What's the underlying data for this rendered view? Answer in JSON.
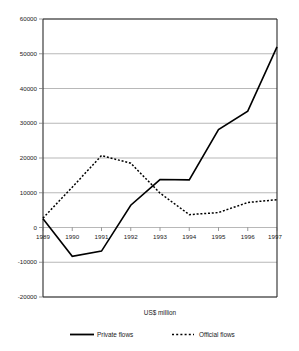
{
  "chart_data": {
    "type": "line",
    "title": "",
    "subtitle": "",
    "xlabel": "US$ million",
    "ylabel": "",
    "x": [
      1989,
      1990,
      1991,
      1992,
      1993,
      1994,
      1995,
      1996,
      1997
    ],
    "categories": [
      "1989",
      "1990",
      "1991",
      "1992",
      "1993",
      "1994",
      "1995",
      "1996",
      "1997"
    ],
    "series": [
      {
        "name": "Private flows",
        "style": "solid",
        "color": "#000000",
        "values": [
          2500,
          -8300,
          -6800,
          6400,
          13800,
          13700,
          28200,
          33500,
          52000
        ]
      },
      {
        "name": "Official flows",
        "style": "dotted",
        "color": "#000000",
        "values": [
          2700,
          11600,
          20700,
          18500,
          9900,
          3700,
          4300,
          7200,
          8000
        ]
      }
    ],
    "ylim": [
      -20000,
      60000
    ],
    "ytick_labels": [
      "60000",
      "50000",
      "40000",
      "30000",
      "20000",
      "10000",
      "0",
      "-10000",
      "-20000"
    ],
    "ytick_values": [
      60000,
      50000,
      40000,
      30000,
      20000,
      10000,
      0,
      -10000,
      -20000
    ],
    "xtick_labels": [
      "1989",
      "1990",
      "1991",
      "1992",
      "1993",
      "1994",
      "1995",
      "1996",
      "1997"
    ],
    "grid": "horizontal",
    "legend_position": "bottom",
    "legend": [
      {
        "label": "Private flows",
        "style": "solid"
      },
      {
        "label": "Official flows",
        "style": "dotted"
      }
    ]
  },
  "axis_title": "US$ million",
  "legend_labels": {
    "private": "Private flows",
    "official": "Official flows"
  },
  "ytick_0": "60000",
  "ytick_1": "50000",
  "ytick_2": "40000",
  "ytick_3": "30000",
  "ytick_4": "20000",
  "ytick_5": "10000",
  "ytick_6": "0",
  "ytick_7": "-10000",
  "ytick_8": "-20000",
  "xtick_0": "1989",
  "xtick_1": "1990",
  "xtick_2": "1991",
  "xtick_3": "1992",
  "xtick_4": "1993",
  "xtick_5": "1994",
  "xtick_6": "1995",
  "xtick_7": "1996",
  "xtick_8": "1997"
}
